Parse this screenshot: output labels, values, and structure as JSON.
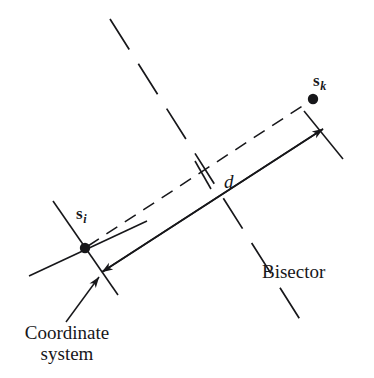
{
  "figure": {
    "kind": "geometry-diagram",
    "background_color": "#ffffff",
    "ink_color": "#17171a",
    "width": 374,
    "height": 378
  },
  "labels": {
    "site_i": {
      "symbol": "s",
      "subscript": "i"
    },
    "site_k": {
      "symbol": "s",
      "subscript": "k"
    },
    "distance": "d",
    "bisector": "Bisector",
    "coordinate_system_line1": "Coordinate",
    "coordinate_system_line2": "system"
  },
  "geometry": {
    "site_i_point": [
      85,
      248
    ],
    "site_k_point": [
      313,
      99
    ],
    "bisector_crossing": [
      203,
      175
    ],
    "connector_style": "dashed",
    "distance_line_style": "solid-double-arrow",
    "bisector_style": "long-dashed"
  }
}
